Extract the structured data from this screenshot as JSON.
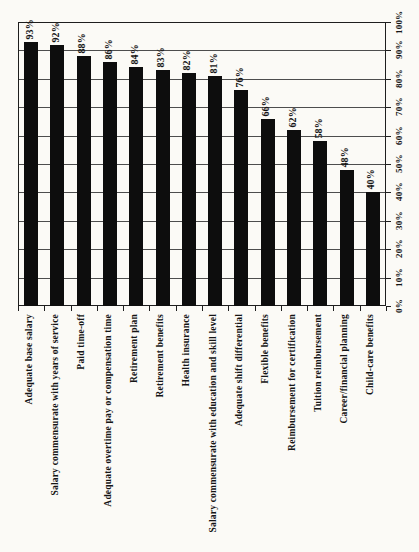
{
  "chart_data": {
    "type": "bar",
    "title": "",
    "xlabel": "",
    "ylabel": "",
    "orientation": "bars vertical; all text rotated 90deg counter-clockwise (scanned sideways horizontal-bar chart)",
    "categories": [
      "Adequate base salary",
      "Salary commensurate with years of service",
      "Paid time-off",
      "Adequate overtime pay or compensation time",
      "Retirement plan",
      "Retirement benefits",
      "Health insurance",
      "Salary commensurate with education and skill level",
      "Adequate shift differential",
      "Flexible benefits",
      "Reimbursement for certification",
      "Tuition reimbursement",
      "Career/financial planning",
      "Child-care benefits"
    ],
    "values": [
      93,
      92,
      88,
      86,
      84,
      83,
      82,
      81,
      76,
      66,
      62,
      58,
      48,
      40
    ],
    "value_labels": [
      "93%",
      "92%",
      "88%",
      "86%",
      "84%",
      "83%",
      "82%",
      "81%",
      "76%",
      "66%",
      "62%",
      "58%",
      "48%",
      "40%"
    ],
    "value_axis": {
      "min": 0,
      "max": 100,
      "step": 10,
      "tick_labels": [
        "0%",
        "10%",
        "20%",
        "30%",
        "40%",
        "50%",
        "60%",
        "70%",
        "80%",
        "90%",
        "100%"
      ],
      "position": "right edge (rotated chart)"
    },
    "grid": true,
    "legend": null,
    "colors": {
      "bar": "#0d0d0d",
      "gridline": "#4d4d4d",
      "frame": "#1e1e1e",
      "text": "#151515",
      "background": "#fbfaf6"
    }
  }
}
